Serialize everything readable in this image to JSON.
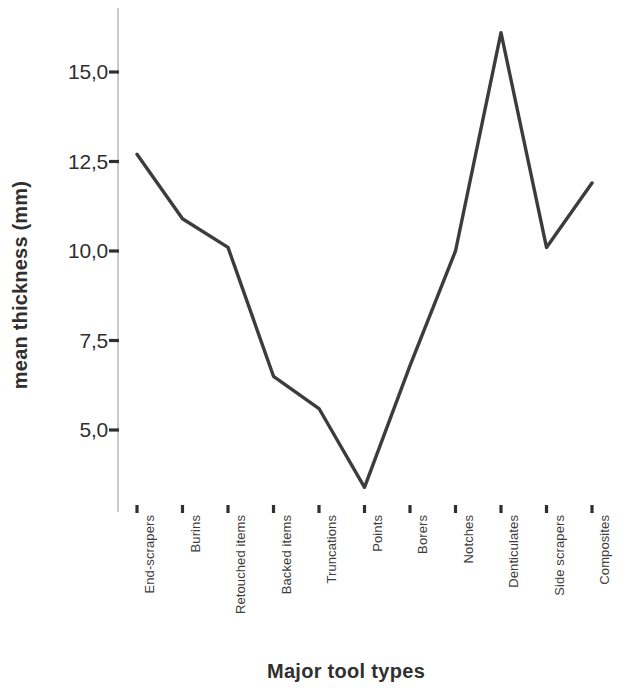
{
  "chart_data": {
    "type": "line",
    "title": "",
    "xlabel": "Major tool types",
    "ylabel": "mean thickness (mm)",
    "categories": [
      "End-scrapers",
      "Burins",
      "Retouched items",
      "Backed items",
      "Truncations",
      "Points",
      "Borers",
      "Notches",
      "Denticulates",
      "Side scrapers",
      "Composites"
    ],
    "values": [
      12.7,
      10.9,
      10.1,
      6.5,
      5.6,
      3.4,
      6.8,
      10.0,
      16.1,
      10.1,
      11.9
    ],
    "series": [
      {
        "name": "mean thickness",
        "values": [
          12.7,
          10.9,
          10.1,
          6.5,
          5.6,
          3.4,
          6.8,
          10.0,
          16.1,
          10.1,
          11.9
        ]
      }
    ],
    "ytick_labels": [
      "15,0",
      "12,5",
      "10,0",
      "7,5",
      "5,0"
    ],
    "ytick_values": [
      15.0,
      12.5,
      10.0,
      7.5,
      5.0
    ],
    "ylim": [
      2.5,
      17.0
    ],
    "grid": false,
    "legend": "none",
    "line_color": "#3c3c3c",
    "axis_color": "#9a9a9a"
  }
}
